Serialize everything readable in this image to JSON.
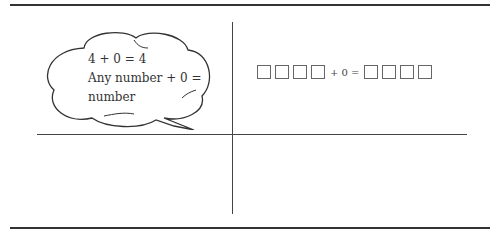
{
  "cloud": {
    "lines": [
      "4 + 0 = 4",
      "Any number + 0 =",
      "number"
    ]
  },
  "equation": {
    "left_boxes": 4,
    "middle_text": "+ 0 =",
    "right_boxes": 4
  }
}
